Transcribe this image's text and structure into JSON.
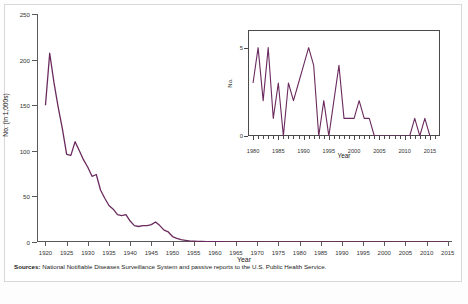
{
  "figure": {
    "source_prefix": "Sources:",
    "source_text": "National Notifiable Diseases Surveillance System and passive reports to the U.S. Public Health Service.",
    "bottom_partial": "",
    "line_color": "#6b2a5e",
    "axis_color": "#595959"
  },
  "chart_data": [
    {
      "id": "main",
      "type": "line",
      "title": "",
      "xlabel": "Year",
      "ylabel": "No. (in 1,000s)",
      "xlim": [
        1918,
        2016
      ],
      "ylim": [
        0,
        250
      ],
      "yticks": [
        0,
        50,
        100,
        150,
        200,
        250
      ],
      "xticks": [
        1920,
        1925,
        1930,
        1935,
        1940,
        1945,
        1950,
        1955,
        1960,
        1965,
        1970,
        1975,
        1980,
        1985,
        1990,
        1995,
        2000,
        2005,
        2010,
        2015
      ],
      "grid": false,
      "legend": "none",
      "x": [
        1920,
        1921,
        1922,
        1923,
        1924,
        1925,
        1926,
        1927,
        1928,
        1929,
        1930,
        1931,
        1932,
        1933,
        1934,
        1935,
        1936,
        1937,
        1938,
        1939,
        1940,
        1941,
        1942,
        1943,
        1944,
        1945,
        1946,
        1947,
        1948,
        1949,
        1950,
        1951,
        1952,
        1953,
        1954,
        1955,
        1956,
        1957,
        1958,
        1959,
        1960,
        1961,
        1962,
        1963,
        1964,
        1965,
        1966,
        1967,
        1968,
        1969,
        1970,
        1971,
        1972,
        1973,
        1974,
        1975,
        1976,
        1977,
        1978,
        1979,
        1980,
        1981,
        1982,
        1983,
        1984,
        1985,
        1986,
        1987,
        1988,
        1989,
        1990,
        1991,
        1992,
        1993,
        1994,
        1995,
        1996,
        1997,
        1998,
        1999,
        2000,
        2001,
        2002,
        2003,
        2004,
        2005,
        2006,
        2007,
        2008,
        2009,
        2010,
        2011,
        2012,
        2013,
        2014,
        2015
      ],
      "values": [
        150,
        207,
        175,
        148,
        124,
        96,
        95,
        110,
        100,
        90,
        82,
        72,
        74,
        57,
        48,
        40,
        36,
        30,
        29,
        30,
        23,
        18,
        17,
        18,
        18,
        19,
        22,
        18,
        13,
        11,
        6.0,
        4.0,
        2.5,
        1.8,
        1.2,
        0.9,
        0.7,
        0.6,
        0.5,
        0.4,
        0.3,
        0.3,
        0.25,
        0.2,
        0.2,
        0.16,
        0.12,
        0.1,
        0.08,
        0.06,
        0.04,
        0.02,
        0.02,
        0.01,
        0.01,
        0.005,
        0.005,
        0.005,
        0.003,
        0.003,
        0.003,
        0.005,
        0.002,
        0.005,
        0.001,
        0.003,
        0.0,
        0.002,
        0.002,
        0.004,
        0.004,
        0.005,
        0.004,
        0.0,
        0.002,
        0.0,
        0.002,
        0.004,
        0.001,
        0.001,
        0.001,
        0.001,
        0.002,
        0.001,
        0.0,
        0.0,
        0.0,
        0.0,
        0.0,
        0.0,
        0.0,
        0.0,
        0.001,
        0.0,
        0.001,
        0.0
      ]
    },
    {
      "id": "inset",
      "type": "line",
      "title": "",
      "xlabel": "Year",
      "ylabel": "No.",
      "xlim": [
        1979,
        2017
      ],
      "ylim": [
        0,
        6
      ],
      "yticks": [
        0,
        5
      ],
      "xticks": [
        1980,
        1985,
        1990,
        1995,
        2000,
        2005,
        2010,
        2015
      ],
      "grid": false,
      "legend": "none",
      "x": [
        1980,
        1981,
        1982,
        1983,
        1984,
        1985,
        1986,
        1987,
        1988,
        1989,
        1990,
        1991,
        1992,
        1993,
        1994,
        1995,
        1996,
        1997,
        1998,
        1999,
        2000,
        2001,
        2002,
        2003,
        2004,
        2005,
        2006,
        2007,
        2008,
        2009,
        2010,
        2011,
        2012,
        2013,
        2014,
        2015
      ],
      "values": [
        3,
        5,
        2,
        5,
        1,
        3,
        0,
        3,
        2,
        3,
        4,
        5,
        4,
        0,
        2,
        0,
        2,
        4,
        1,
        1,
        1,
        2,
        1,
        1,
        0,
        0,
        0,
        0,
        0,
        0,
        0,
        0,
        1,
        0,
        1,
        0
      ]
    }
  ]
}
